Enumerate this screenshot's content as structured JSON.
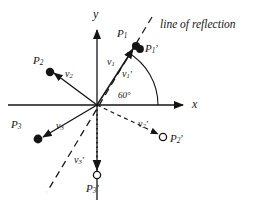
{
  "figure": {
    "type": "geometry-diagram",
    "background": "#ffffff",
    "ink_color": "#151515",
    "ghost_color": "#c9c2bb"
  },
  "ghost_text": {
    "top": "",
    "middle": ""
  },
  "axes": {
    "x_label": "x",
    "y_label": "y",
    "origin": {
      "x": 97,
      "y": 105
    },
    "x_arrow_tip": {
      "x": 188,
      "y": 105
    },
    "y_arrow_tip": {
      "x": 97,
      "y": 25
    }
  },
  "reflection_line": {
    "label": "line of reflection",
    "angle_deg": 60,
    "style": "dashed",
    "from": {
      "x": 152,
      "y": 17
    },
    "to": {
      "x": 47,
      "y": 192
    }
  },
  "angle_marker": {
    "label": "60°",
    "value": 60,
    "unit": "degrees",
    "label_pos": {
      "x": 120,
      "y": 96
    }
  },
  "points": [
    {
      "name": "P1",
      "label_main": "P",
      "label_sub": "1",
      "prime": false,
      "marker": "filled",
      "x": 136,
      "y": 46,
      "label_x": 119,
      "label_y": 33
    },
    {
      "name": "P1p",
      "label_main": "P",
      "label_sub": "1",
      "prime": true,
      "marker": "filled",
      "x": 140,
      "y": 49,
      "label_x": 145,
      "label_y": 48
    },
    {
      "name": "P2",
      "label_main": "P",
      "label_sub": "2",
      "prime": false,
      "marker": "filled",
      "x": 50,
      "y": 72,
      "label_x": 35,
      "label_y": 61
    },
    {
      "name": "P2p",
      "label_main": "P",
      "label_sub": "2",
      "prime": true,
      "marker": "open",
      "x": 163,
      "y": 137,
      "label_x": 170,
      "label_y": 138
    },
    {
      "name": "P3",
      "label_main": "P",
      "label_sub": "3",
      "prime": false,
      "marker": "filled",
      "x": 38,
      "y": 139,
      "label_x": 12,
      "label_y": 125
    },
    {
      "name": "P3p",
      "label_main": "P",
      "label_sub": "3",
      "prime": true,
      "marker": "open",
      "x": 97,
      "y": 175,
      "label_x": 88,
      "label_y": 188
    }
  ],
  "vectors": [
    {
      "name": "v1",
      "label_main": "v",
      "label_sub": "1",
      "prime": false,
      "style": "solid",
      "to_point": "P1",
      "label_x": 111,
      "label_y": 62
    },
    {
      "name": "v1p",
      "label_main": "v",
      "label_sub": "1",
      "prime": true,
      "style": "solid",
      "to_point": "P1p",
      "label_x": 124,
      "label_y": 74
    },
    {
      "name": "v2",
      "label_main": "v",
      "label_sub": "2",
      "prime": false,
      "style": "solid",
      "to_point": "P2",
      "label_x": 67,
      "label_y": 74
    },
    {
      "name": "v2p",
      "label_main": "v",
      "label_sub": "2",
      "prime": true,
      "style": "dashed",
      "to_point": "P2p",
      "label_x": 140,
      "label_y": 124
    },
    {
      "name": "v3",
      "label_main": "v",
      "label_sub": "3",
      "prime": false,
      "style": "solid",
      "to_point": "P3",
      "label_x": 58,
      "label_y": 126
    },
    {
      "name": "v3p",
      "label_main": "v",
      "label_sub": "3",
      "prime": true,
      "style": "dotted",
      "to_point": "P3p",
      "label_x": 76,
      "label_y": 160
    }
  ]
}
